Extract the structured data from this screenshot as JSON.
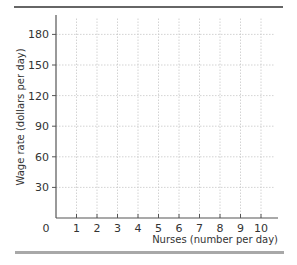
{
  "chart_data": {
    "type": "line",
    "title": "",
    "xlabel": "Nurses (number per day)",
    "ylabel": "Wage rate (dollars per day)",
    "x_ticks": [
      0,
      1,
      2,
      3,
      4,
      5,
      6,
      7,
      8,
      9,
      10
    ],
    "y_ticks": [
      30,
      60,
      90,
      120,
      150,
      180
    ],
    "origin_label": "0",
    "xlim": [
      0,
      10.8
    ],
    "ylim": [
      0,
      195
    ],
    "grid": true,
    "grid_style": "dotted",
    "series": [],
    "legend": null
  },
  "colors": {
    "axis": "#555555",
    "grid": "#c8c8c8",
    "top_rule": "#333333",
    "bottom_bar": "#a8a8a8",
    "text": "#333333"
  }
}
